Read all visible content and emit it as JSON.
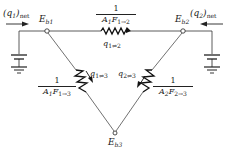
{
  "diagram": {
    "nodes": [
      {
        "id": "Eb1",
        "label": "E",
        "sub": "b1",
        "x": 47,
        "y": 31
      },
      {
        "id": "Eb2",
        "label": "E",
        "sub": "b2",
        "x": 183,
        "y": 31
      },
      {
        "id": "Eb3",
        "label": "E",
        "sub": "b3",
        "x": 115,
        "y": 133
      }
    ],
    "inputs": {
      "q1": {
        "label": "(q",
        "sub": "1",
        "tail": ")",
        "suffix": "net"
      },
      "q2": {
        "label": "(q",
        "sub": "2",
        "tail": ")",
        "suffix": "net"
      }
    },
    "resistors": {
      "r12": {
        "num": "1",
        "den": "A",
        "den_sub1": "1",
        "den_mid": "F",
        "den_sub2": "1→2",
        "flow": "q",
        "flow_sub": "1⇌2"
      },
      "r13": {
        "num": "1",
        "den": "A",
        "den_sub1": "1",
        "den_mid": "F",
        "den_sub2": "1→3",
        "flow": "q",
        "flow_sub": "1⇌3"
      },
      "r23": {
        "num": "1",
        "den": "A",
        "den_sub1": "2",
        "den_mid": "F",
        "den_sub2": "2→3",
        "flow": "q",
        "flow_sub": "2⇌3"
      }
    },
    "colors": {
      "line": "#333333",
      "resistor": "#111111"
    }
  }
}
